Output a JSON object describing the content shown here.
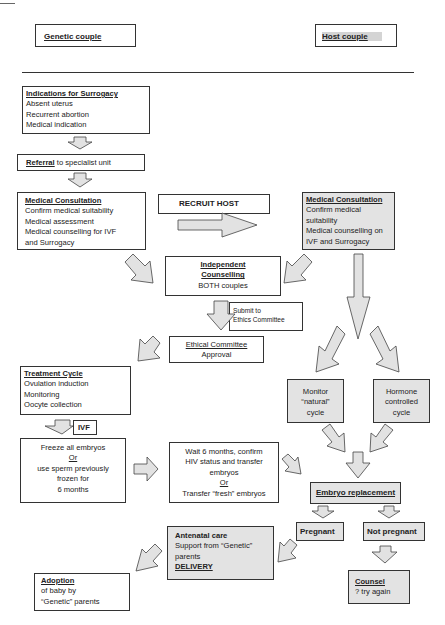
{
  "header": {
    "genetic_couple": "Genetic couple",
    "host_couple": "Host couple"
  },
  "indications": {
    "title": "Indications for Surrogacy",
    "items": [
      "Absent uterus",
      "Recurrent abortion",
      "Medical indication"
    ]
  },
  "referral": {
    "title": "Referral",
    "text": " to specialist unit"
  },
  "medical_consultation_genetic": {
    "title": "Medical Consultation",
    "items": [
      "Confirm medical suitability",
      "Medical assessment",
      "Medical counselling for IVF",
      "and Surrogacy"
    ]
  },
  "recruit_host": "RECRUIT HOST",
  "medical_consultation_host": {
    "title": "Medical Consultation",
    "items": [
      "Confirm medical",
      "suitability",
      "Medical counselling on",
      "IVF and Surrogacy"
    ]
  },
  "independent_counselling": {
    "title_line1": "Independent",
    "title_line2": "Counselling",
    "text": "BOTH couples"
  },
  "submit_ethics": {
    "line1": "Submit to",
    "line2": "Ethics Committee"
  },
  "ethical_committee": {
    "title": "Ethical Committee",
    "text": "Approval"
  },
  "treatment_cycle": {
    "title": "Treatment Cycle",
    "items": [
      "Ovulation induction",
      "Monitoring",
      "Oocyte collection"
    ]
  },
  "ivf_label": "IVF",
  "freeze": {
    "line1": "Freeze all embryos",
    "or": "Or",
    "line2": "use sperm previously",
    "line3": "frozen for",
    "line4": "6 months"
  },
  "wait": {
    "line1": "Wait 6 months, confirm",
    "line2": "HIV status and transfer",
    "line3": "embryos",
    "or": "Or",
    "line4": "Transfer “fresh” embryos"
  },
  "monitor_natural": {
    "line1": "Monitor",
    "line2": "“natural”",
    "line3": "cycle"
  },
  "hormone_controlled": {
    "line1": "Hormone",
    "line2": "controlled",
    "line3": "cycle"
  },
  "embryo_replacement": "Embryo replacement",
  "pregnant": "Pregnant",
  "not_pregnant": "Not pregnant",
  "antenatal": {
    "title": "Antenatal care",
    "line1": "Support from “Genetic”",
    "line2": "parents",
    "delivery": "DELIVERY"
  },
  "counsel": {
    "title": "Counsel",
    "text": "? try again"
  },
  "adoption": {
    "title": "Adoption",
    "line1": "of baby by",
    "line2": "“Genetic” parents"
  }
}
